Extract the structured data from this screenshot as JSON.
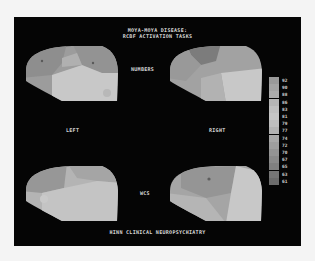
{
  "figure": {
    "title_line1": "MOYA-MOYA DISEASE:",
    "title_line2": "RCBF ACTIVATION TASKS",
    "label_task_top": "NUMBERS",
    "label_task_bottom": "WCS",
    "label_left": "LEFT",
    "label_right": "RIGHT",
    "footer": "HINN CLINICAL NEUROPSYCHIATRY"
  },
  "legend": {
    "values": [
      "92",
      "90",
      "88",
      "86",
      "83",
      "81",
      "79",
      "77",
      "74",
      "72",
      "70",
      "67",
      "65",
      "63",
      "61"
    ],
    "colors": [
      "#9a9a9a",
      "#a4a4a4",
      "#acacac",
      "#b6b6b6",
      "#c0c0c0",
      "#c6c6c6",
      "#bdbdbd",
      "#b2b2b2",
      "#a8a8a8",
      "#9e9e9e",
      "#949494",
      "#8a8a8a",
      "#808080",
      "#767676",
      "#6c6c6c"
    ]
  },
  "maps": [
    {
      "id": "numbers-left",
      "task": "NUMBERS",
      "hemisphere": "LEFT"
    },
    {
      "id": "numbers-right",
      "task": "NUMBERS",
      "hemisphere": "RIGHT"
    },
    {
      "id": "wcs-left",
      "task": "WCS",
      "hemisphere": "LEFT"
    },
    {
      "id": "wcs-right",
      "task": "WCS",
      "hemisphere": "RIGHT"
    }
  ]
}
